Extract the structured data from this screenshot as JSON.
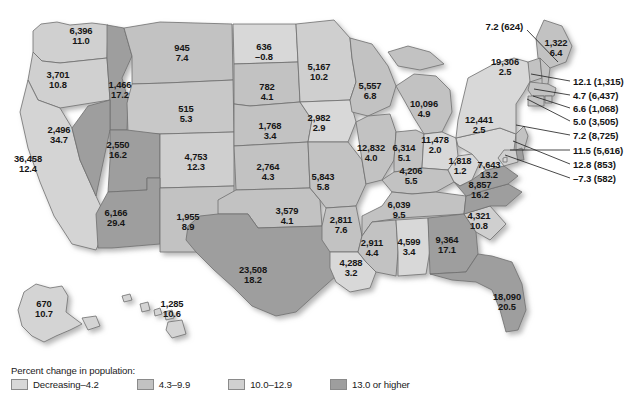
{
  "map": {
    "title": "United States population and percent change by state",
    "shadow_color": "#c9c9c9",
    "border_color": "#6f6f6f",
    "note": "Each state is labeled with population (thousands) on the top line and percent change on the bottom line."
  },
  "legend": {
    "title": "Percent change in population:",
    "items": [
      {
        "label": "Decreasing–4.2",
        "color": "#d8d8d8"
      },
      {
        "label": "4.3–9.9",
        "color": "#c2c2c2"
      },
      {
        "label": "10.0–12.9",
        "color": "#d0d0d0"
      },
      {
        "label": "13.0 or higher",
        "color": "#9e9e9e"
      }
    ]
  },
  "chart_data": {
    "type": "map",
    "title": "Percent change in population",
    "value_fields": [
      "population",
      "percent_change"
    ],
    "bins": [
      "Decreasing–4.2",
      "4.3–9.9",
      "10.0–12.9",
      "13.0 or higher"
    ],
    "states": [
      {
        "code": "WA",
        "population": "6,396",
        "percent_change": "11.0",
        "bin": 2,
        "x": 81,
        "y": 36
      },
      {
        "code": "OR",
        "population": "3,701",
        "percent_change": "10.8",
        "bin": 2,
        "x": 58,
        "y": 80
      },
      {
        "code": "ID",
        "population": "1,466",
        "percent_change": "17.2",
        "bin": 3,
        "x": 120,
        "y": 90
      },
      {
        "code": "MT",
        "population": "945",
        "percent_change": "7.4",
        "bin": 1,
        "x": 182,
        "y": 53
      },
      {
        "code": "WY",
        "population": "515",
        "percent_change": "5.3",
        "bin": 1,
        "x": 186,
        "y": 114
      },
      {
        "code": "ND",
        "population": "636",
        "percent_change": "–0.8",
        "bin": 0,
        "x": 264,
        "y": 52
      },
      {
        "code": "SD",
        "population": "782",
        "percent_change": "4.1",
        "bin": 1,
        "x": 267,
        "y": 92
      },
      {
        "code": "NE",
        "population": "1,768",
        "percent_change": "3.4",
        "bin": 1,
        "x": 270,
        "y": 131
      },
      {
        "code": "MN",
        "population": "5,167",
        "percent_change": "10.2",
        "bin": 2,
        "x": 319,
        "y": 72
      },
      {
        "code": "IA",
        "population": "2,982",
        "percent_change": "2.9",
        "bin": 0,
        "x": 319,
        "y": 123
      },
      {
        "code": "WI",
        "population": "5,557",
        "percent_change": "6.8",
        "bin": 1,
        "x": 370,
        "y": 91
      },
      {
        "code": "MI",
        "population": "10,096",
        "percent_change": "4.9",
        "bin": 1,
        "x": 424,
        "y": 109
      },
      {
        "code": "NV",
        "population": "2,496",
        "percent_change": "34.7",
        "bin": 3,
        "x": 59,
        "y": 135
      },
      {
        "code": "CA",
        "population": "36,458",
        "percent_change": "12.4",
        "bin": 2,
        "x": 28,
        "y": 164
      },
      {
        "code": "UT",
        "population": "2,550",
        "percent_change": "16.2",
        "bin": 3,
        "x": 118,
        "y": 150
      },
      {
        "code": "CO",
        "population": "4,753",
        "percent_change": "12.3",
        "bin": 2,
        "x": 196,
        "y": 162
      },
      {
        "code": "AZ",
        "population": "6,166",
        "percent_change": "29.4",
        "bin": 3,
        "x": 116,
        "y": 218
      },
      {
        "code": "NM",
        "population": "1,955",
        "percent_change": "8.9",
        "bin": 1,
        "x": 188,
        "y": 222
      },
      {
        "code": "KS",
        "population": "2,764",
        "percent_change": "4.3",
        "bin": 1,
        "x": 268,
        "y": 172
      },
      {
        "code": "MO",
        "population": "5,843",
        "percent_change": "5.8",
        "bin": 1,
        "x": 323,
        "y": 182
      },
      {
        "code": "IL",
        "population": "12,832",
        "percent_change": "4.0",
        "bin": 1,
        "x": 371,
        "y": 153
      },
      {
        "code": "IN",
        "population": "6,314",
        "percent_change": "5.1",
        "bin": 1,
        "x": 404,
        "y": 153
      },
      {
        "code": "OH",
        "population": "11,478",
        "percent_change": "2.0",
        "bin": 0,
        "x": 435,
        "y": 145
      },
      {
        "code": "KY",
        "population": "4,206",
        "percent_change": "5.5",
        "bin": 1,
        "x": 411,
        "y": 176
      },
      {
        "code": "WV",
        "population": "1,818",
        "percent_change": "1.2",
        "bin": 0,
        "x": 460,
        "y": 166
      },
      {
        "code": "OK",
        "population": "3,579",
        "percent_change": "4.1",
        "bin": 1,
        "x": 287,
        "y": 216
      },
      {
        "code": "AR",
        "population": "2,811",
        "percent_change": "7.6",
        "bin": 1,
        "x": 341,
        "y": 225
      },
      {
        "code": "TN",
        "population": "6,039",
        "percent_change": "9.5",
        "bin": 1,
        "x": 399,
        "y": 210
      },
      {
        "code": "TX",
        "population": "23,508",
        "percent_change": "18.2",
        "bin": 3,
        "x": 253,
        "y": 275
      },
      {
        "code": "LA",
        "population": "4,288",
        "percent_change": "3.2",
        "bin": 0,
        "x": 351,
        "y": 268
      },
      {
        "code": "MS",
        "population": "2,911",
        "percent_change": "4.4",
        "bin": 1,
        "x": 372,
        "y": 248
      },
      {
        "code": "AL",
        "population": "4,599",
        "percent_change": "3.4",
        "bin": 0,
        "x": 409,
        "y": 247
      },
      {
        "code": "GA",
        "population": "9,364",
        "percent_change": "17.1",
        "bin": 3,
        "x": 447,
        "y": 245
      },
      {
        "code": "SC",
        "population": "4,321",
        "percent_change": "10.8",
        "bin": 2,
        "x": 479,
        "y": 221
      },
      {
        "code": "NC",
        "population": "8,857",
        "percent_change": "16.2",
        "bin": 3,
        "x": 480,
        "y": 190
      },
      {
        "code": "VA",
        "population": "7,643",
        "percent_change": "13.2",
        "bin": 3,
        "x": 489,
        "y": 170
      },
      {
        "code": "PA",
        "population": "12,441",
        "percent_change": "2.5",
        "bin": 0,
        "x": 479,
        "y": 125
      },
      {
        "code": "NY",
        "population": "19,306",
        "percent_change": "2.5",
        "bin": 0,
        "x": 505,
        "y": 67
      },
      {
        "code": "ME",
        "population": "1,322",
        "percent_change": "6.4",
        "bin": 1,
        "x": 556,
        "y": 48
      },
      {
        "code": "FL",
        "population": "18,090",
        "percent_change": "20.5",
        "bin": 3,
        "x": 507,
        "y": 302
      },
      {
        "code": "AK",
        "population": "670",
        "percent_change": "10.7",
        "bin": 2,
        "x": 44,
        "y": 309
      },
      {
        "code": "HI",
        "population": "1,285",
        "percent_change": "10.6",
        "bin": 2,
        "x": 172,
        "y": 309
      }
    ],
    "callouts": [
      {
        "code": "VT",
        "text": "7.2 (624)",
        "side": "left",
        "x": 523,
        "y": 26,
        "lx1": 527,
        "ly1": 30,
        "lx2": 558,
        "ly2": 62
      },
      {
        "code": "NH",
        "text": "12.1 (1,315)",
        "side": "right",
        "x": 573,
        "y": 81,
        "lx1": 570,
        "ly1": 81,
        "lx2": 531,
        "ly2": 74
      },
      {
        "code": "MA",
        "text": "4.7 (6,437)",
        "side": "right",
        "x": 573,
        "y": 95,
        "lx1": 570,
        "ly1": 95,
        "lx2": 534,
        "ly2": 89
      },
      {
        "code": "RI",
        "text": "6.6 (1,068)",
        "side": "right",
        "x": 573,
        "y": 108,
        "lx1": 570,
        "ly1": 108,
        "lx2": 533,
        "ly2": 96
      },
      {
        "code": "CT",
        "text": "5.0 (3,505)",
        "side": "right",
        "x": 573,
        "y": 121,
        "lx1": 570,
        "ly1": 121,
        "lx2": 527,
        "ly2": 99
      },
      {
        "code": "NJ",
        "text": "7.2 (8,725)",
        "side": "right",
        "x": 573,
        "y": 135,
        "lx1": 570,
        "ly1": 135,
        "lx2": 516,
        "ly2": 125
      },
      {
        "code": "MD",
        "text": "11.5 (5,616)",
        "side": "right",
        "x": 573,
        "y": 150,
        "lx1": 570,
        "ly1": 150,
        "lx2": 510,
        "ly2": 150
      },
      {
        "code": "DE",
        "text": "12.8 (853)",
        "side": "right",
        "x": 573,
        "y": 164,
        "lx1": 570,
        "ly1": 164,
        "lx2": 513,
        "ly2": 141
      },
      {
        "code": "DC",
        "text": "–7.3 (582)",
        "side": "right",
        "x": 573,
        "y": 178,
        "lx1": 570,
        "ly1": 178,
        "lx2": 505,
        "ly2": 155
      }
    ]
  }
}
